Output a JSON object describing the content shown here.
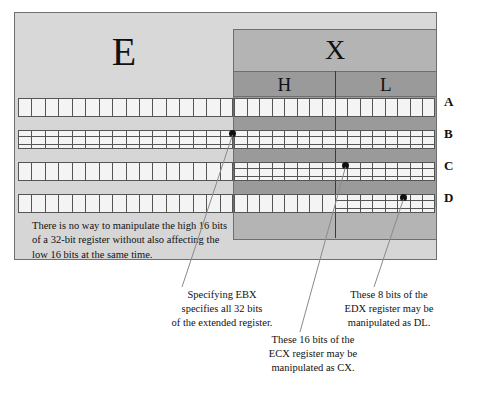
{
  "diagram": {
    "register_prefix": "E",
    "register_suffix": "X",
    "halves": [
      {
        "key": "H",
        "label": "H"
      },
      {
        "key": "L",
        "label": "L"
      }
    ],
    "rows": [
      {
        "label": "A",
        "name": "row-a",
        "left_subdivided": false,
        "right_subdivided": false
      },
      {
        "label": "B",
        "name": "row-b",
        "left_subdivided": true,
        "right_subdivided": true
      },
      {
        "label": "C",
        "name": "row-c",
        "left_subdivided": false,
        "right_subdivided": true
      },
      {
        "label": "D",
        "name": "row-d",
        "left_subdivided": false,
        "right_subdivided": "right-half-only"
      }
    ],
    "note": "There is no way to manipulate the high 16 bits of a 32-bit register without also affecting the low 16 bits at the same time.",
    "callouts": [
      {
        "name": "ebx-callout",
        "lines": [
          "Specifying EBX",
          "specifies all 32 bits",
          "of the extended register."
        ]
      },
      {
        "name": "edx-callout",
        "lines": [
          "These 8 bits of the",
          "EDX register may be",
          "manipulated as DL."
        ]
      },
      {
        "name": "ecx-callout",
        "lines": [
          "These 16 bits of the",
          "ECX register may be",
          "manipulated as CX."
        ]
      }
    ],
    "colors": {
      "panel_background": "#d6d6d6",
      "x_block": "#b4b4b4",
      "hl_block": "#9a9a9a",
      "cell_fill": "#f4f4f4",
      "line": "#555555",
      "border": "#6e6e6e",
      "text": "#111111"
    }
  }
}
